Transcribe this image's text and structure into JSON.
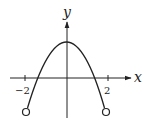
{
  "diagram": {
    "type": "function-graph",
    "axes": {
      "x_label": "x",
      "y_label": "y",
      "x_ticks": [
        {
          "value": -2,
          "label": "−2"
        },
        {
          "value": 2,
          "label": "2"
        }
      ]
    },
    "curve": {
      "shape": "parabola",
      "opens": "down",
      "domain": [
        -2,
        2
      ],
      "endpoints": "open"
    },
    "colors": {
      "stroke": "#222222",
      "background": "#ffffff"
    }
  }
}
